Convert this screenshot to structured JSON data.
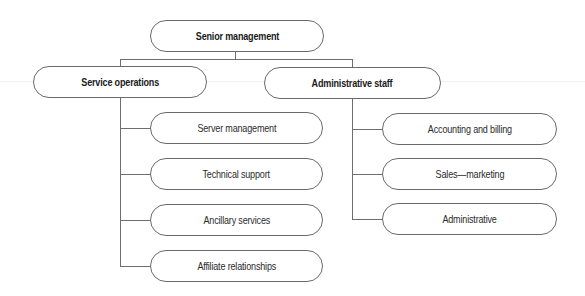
{
  "diagram": {
    "type": "org-chart",
    "root": {
      "label": "Senior management",
      "children": [
        {
          "label": "Service operations",
          "children": [
            {
              "label": "Server management"
            },
            {
              "label": "Technical support"
            },
            {
              "label": "Ancillary services"
            },
            {
              "label": "Affiliate relationships"
            }
          ]
        },
        {
          "label": "Administrative staff",
          "children": [
            {
              "label": "Accounting and billing"
            },
            {
              "label": "Sales—marketing"
            },
            {
              "label": "Administrative"
            }
          ]
        }
      ]
    },
    "colors": {
      "line": "#6e6e6e",
      "border": "#6a6a6a",
      "text": "#2b2b2b",
      "background": "#ffffff"
    }
  }
}
